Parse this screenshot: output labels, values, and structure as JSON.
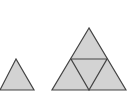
{
  "diagram": {
    "fill_color": "#d3d3d3",
    "stroke_color": "#444444",
    "shapes": [
      {
        "name": "small-triangle",
        "points": "16,59 0,90 34,90"
      },
      {
        "name": "large-triangle",
        "points": "89,28 52,90 126,90"
      },
      {
        "name": "inner-triangle",
        "points": "71,59 107,59 89,90"
      }
    ]
  }
}
